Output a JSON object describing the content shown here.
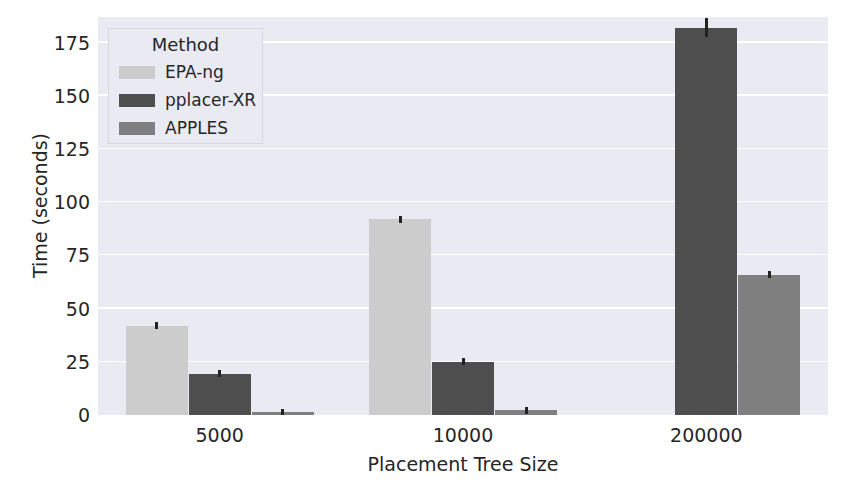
{
  "chart_data": {
    "type": "bar",
    "title": "",
    "xlabel": "Placement Tree Size",
    "ylabel": "Time (seconds)",
    "categories": [
      "5000",
      "10000",
      "200000"
    ],
    "ylim": [
      0,
      187
    ],
    "yticks": [
      0,
      25,
      50,
      75,
      100,
      125,
      150,
      175
    ],
    "ytick_labels": [
      "0",
      "25",
      "50",
      "75",
      "100",
      "125",
      "150",
      "175"
    ],
    "grid": "horizontal",
    "legend_position": "upper-left",
    "legend_title": "Method",
    "series": [
      {
        "name": "EPA-ng",
        "color": "#cccccc",
        "values": [
          42.0,
          92.0,
          null
        ],
        "errors": [
          0.8,
          1.0,
          null
        ]
      },
      {
        "name": "pplacer-XR",
        "color": "#4e4e4e",
        "values": [
          19.5,
          25.0,
          182.0
        ],
        "errors": [
          0.6,
          0.8,
          4.5
        ]
      },
      {
        "name": "APPLES",
        "color": "#7f7f7f",
        "values": [
          1.3,
          2.3,
          66.0
        ],
        "errors": [
          0.3,
          0.4,
          1.8
        ]
      }
    ]
  },
  "colors": {
    "plot_background": "#eaeaf2",
    "figure_background": "#ffffff",
    "gridline": "#ffffff",
    "text": "#262626",
    "error_bar": "#222222"
  }
}
